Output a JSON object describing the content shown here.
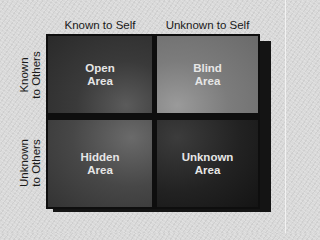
{
  "diagram": {
    "type": "johari-window",
    "column_headers": [
      "Known to Self",
      "Unknown to Self"
    ],
    "row_labels": [
      {
        "line1": "Known",
        "line2": "to Others"
      },
      {
        "line1": "Unknown",
        "line2": "to Others"
      }
    ],
    "cells": [
      {
        "line1": "Open",
        "line2": "Area",
        "row": 0,
        "col": 0
      },
      {
        "line1": "Blind",
        "line2": "Area",
        "row": 0,
        "col": 1
      },
      {
        "line1": "Hidden",
        "line2": "Area",
        "row": 1,
        "col": 0
      },
      {
        "line1": "Unknown",
        "line2": "Area",
        "row": 1,
        "col": 1
      }
    ],
    "colors": {
      "background": "#d9d9d9",
      "open_area": "#3a3a3a",
      "blind_area": "#7c7c7c",
      "hidden_area": "#474747",
      "unknown_area": "#222222",
      "cell_text": "#e6e6e6",
      "label_text": "#1a1a1a"
    }
  }
}
